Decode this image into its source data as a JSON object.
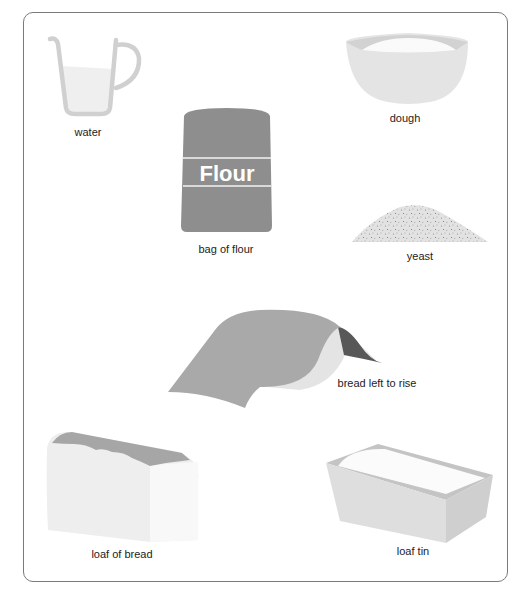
{
  "items": {
    "water": {
      "label": "water",
      "icon": "measuring-jug-icon"
    },
    "dough": {
      "label": "dough",
      "icon": "mixing-bowl-icon"
    },
    "flour": {
      "label": "bag of flour",
      "bag_text": "Flour",
      "icon": "flour-bag-icon"
    },
    "yeast": {
      "label": "yeast",
      "icon": "yeast-pile-icon"
    },
    "rise": {
      "label": "bread left to rise",
      "icon": "covered-dough-icon"
    },
    "loaf": {
      "label": "loaf of bread",
      "icon": "bread-loaf-icon"
    },
    "tin": {
      "label": "loaf tin",
      "icon": "loaf-tin-icon"
    }
  },
  "colors": {
    "frame_border": "#7a7a7a",
    "jug": "#d0d0d0",
    "water": "#efefef",
    "bowl": "#e4e4e4",
    "bowl_rim": "#d2d2d2",
    "flour_bag": "#8e8e8e",
    "cloth": "#a9a9a9",
    "cloth_dark": "#585858",
    "tin": "#dedede",
    "bread_crust": "#a6a6a6"
  }
}
